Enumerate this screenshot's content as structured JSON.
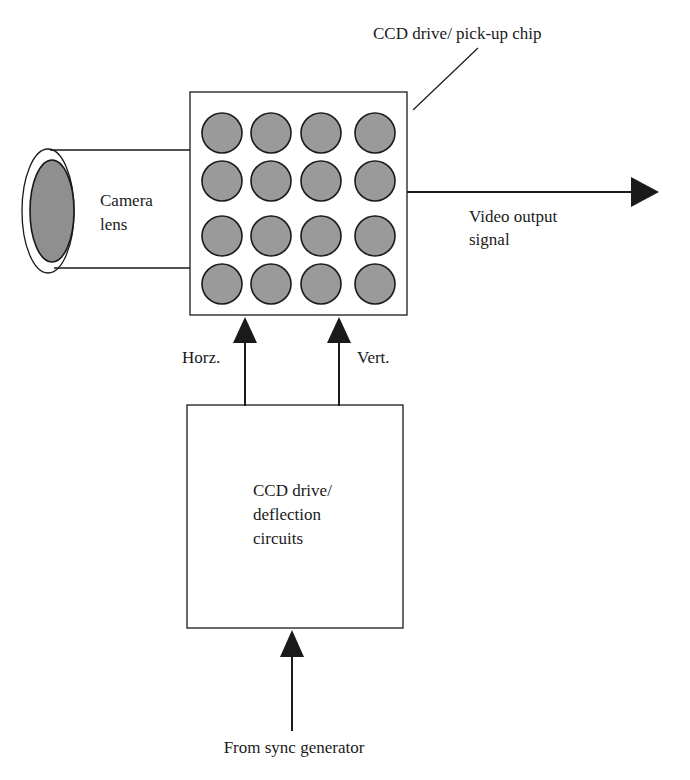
{
  "diagram": {
    "type": "block-diagram",
    "colors": {
      "line": "#1a1a1a",
      "pixel_fill": "#9a9a9a",
      "lens_fill": "#8f8f8f",
      "background": "#ffffff"
    },
    "labels": {
      "chip_title": "CCD drive/ pick-up chip",
      "camera_lens_line1": "Camera",
      "camera_lens_line2": "lens",
      "video_output_line1": "Video output",
      "video_output_line2": "signal",
      "horz": "Horz.",
      "vert": "Vert.",
      "drive_line1": "CCD drive/",
      "drive_line2": "deflection",
      "drive_line3": "circuits",
      "sync_source": "From sync generator"
    },
    "nodes": [
      {
        "id": "camera-lens",
        "label": "Camera lens"
      },
      {
        "id": "ccd-chip",
        "label": "CCD drive/ pick-up chip",
        "pixel_grid": {
          "rows": 4,
          "cols": 4
        }
      },
      {
        "id": "drive-circuits",
        "label": "CCD drive/ deflection circuits"
      },
      {
        "id": "sync-generator",
        "label": "From sync generator"
      }
    ],
    "edges": [
      {
        "from": "ccd-chip",
        "to": "video-output",
        "label": "Video output signal"
      },
      {
        "from": "drive-circuits",
        "to": "ccd-chip",
        "label": "Horz."
      },
      {
        "from": "drive-circuits",
        "to": "ccd-chip",
        "label": "Vert."
      },
      {
        "from": "sync-generator",
        "to": "drive-circuits",
        "label": "From sync generator"
      }
    ]
  }
}
